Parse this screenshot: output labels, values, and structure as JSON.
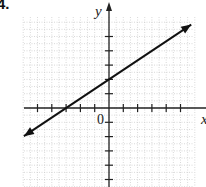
{
  "problem": {
    "number_label": "4."
  },
  "chart_data": {
    "type": "line",
    "title": "",
    "xlabel": "x",
    "ylabel": "y",
    "origin_label": "0",
    "xlim": [
      -6,
      6
    ],
    "ylim": [
      -6,
      6
    ],
    "grid": true,
    "grid_style": "dotted",
    "x_ticks": [
      -5,
      -4,
      -3,
      -2,
      -1,
      1,
      2,
      3,
      4,
      5
    ],
    "y_ticks": [
      -5,
      -4,
      -3,
      -2,
      -1,
      1,
      2,
      3,
      4,
      5
    ],
    "tick_labels_shown": false,
    "series": [
      {
        "name": "line",
        "equation": "y = (2/3)x + 2",
        "slope": 0.6667,
        "y_intercept": 2,
        "x_intercept": -3,
        "points": [
          [
            -3,
            0
          ],
          [
            0,
            2
          ],
          [
            3,
            4
          ]
        ],
        "arrows": "both",
        "color": "#111111"
      }
    ],
    "legend": null
  },
  "colors": {
    "axis": "#222222",
    "grid": "#c8c8c8",
    "line": "#111111"
  }
}
